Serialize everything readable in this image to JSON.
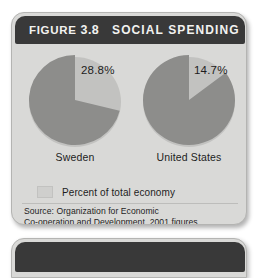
{
  "figure": {
    "header": {
      "prefix": "FIGURE",
      "number": "3.8",
      "title": "SOCIAL SPENDING"
    },
    "legend": {
      "swatch_color": "#cfcfcd",
      "label": "Percent of total economy"
    },
    "source": {
      "line1": "Source: Organization for Economic",
      "line2": "Co-operation and Development, 2001 figures"
    }
  },
  "chart_data": {
    "type": "pie",
    "title": "SOCIAL SPENDING",
    "series_label": "Percent of total economy",
    "units": "percent",
    "legend_position": "bottom-left",
    "charts": [
      {
        "name": "Sweden",
        "label": "Sweden",
        "value": 28.8,
        "value_label": "28.8%",
        "remainder": 71.2,
        "slice_color": "#8d8d8b",
        "cutout_color": "#d9d9d7",
        "start_angle_deg": 0,
        "sweep_deg": 103.7
      },
      {
        "name": "United States",
        "label": "United States",
        "value": 14.7,
        "value_label": "14.7%",
        "remainder": 85.3,
        "slice_color": "#8d8d8b",
        "cutout_color": "#d9d9d7",
        "start_angle_deg": 0,
        "sweep_deg": 52.9
      }
    ]
  }
}
